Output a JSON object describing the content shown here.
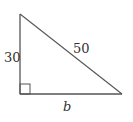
{
  "diagram": {
    "type": "right-triangle",
    "labels": {
      "vertical_leg": "30",
      "hypotenuse": "50",
      "base": "b"
    },
    "right_angle_marker": true,
    "vertices": {
      "top": [
        20,
        14
      ],
      "bottom_left": [
        20,
        94
      ],
      "bottom_right": [
        122,
        94
      ]
    },
    "colors": {
      "stroke": "#555555",
      "text": "#333333",
      "background": "#ffffff"
    }
  }
}
